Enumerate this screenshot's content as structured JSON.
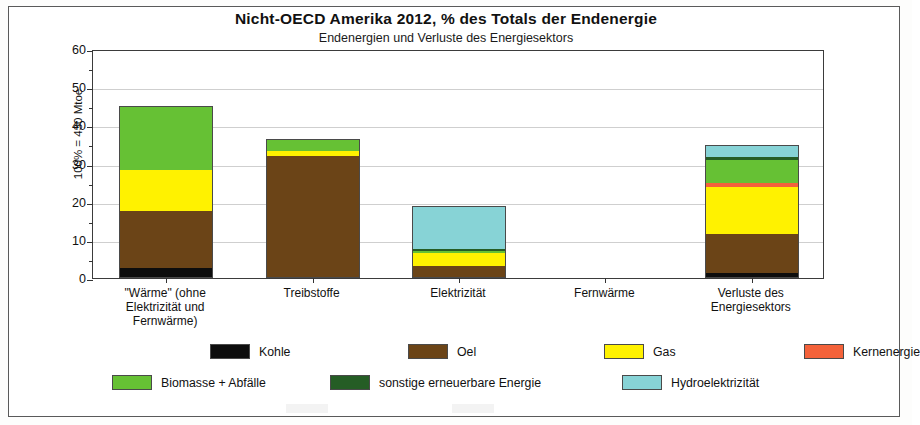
{
  "chart_data": {
    "type": "bar",
    "subtype": "stacked-column",
    "title": "Nicht-OECD Amerika  2012,  % des Totals der Endenergie",
    "subtitle": "Endenergien und Verluste des Energiesektors",
    "ylabel": "100% = 430 Mtoe",
    "xlabel": "",
    "ylim": [
      0,
      60
    ],
    "yticks": [
      0,
      10,
      20,
      30,
      40,
      50,
      60
    ],
    "yminorticks": [
      5,
      15,
      25,
      35,
      45,
      55
    ],
    "grid": "horizontal",
    "legend_position": "bottom",
    "categories": [
      "\"Wärme\" (ohne Elektrizität und Fernwärme)",
      "Treibstoffe",
      "Elektrizität",
      "Fernwärme",
      "Verluste des Energiesektors"
    ],
    "category_lines": [
      [
        "\"Wärme\" (ohne",
        "Elektrizität und",
        "Fernwärme)"
      ],
      [
        "Treibstoffe"
      ],
      [
        "Elektrizität"
      ],
      [
        "Fernwärme"
      ],
      [
        "Verluste des",
        "Energiesektors"
      ]
    ],
    "series": [
      {
        "name": "Kohle",
        "color": "#0d0d0d",
        "values": [
          2.6,
          0.0,
          0.0,
          0.0,
          1.3
        ]
      },
      {
        "name": "Oel",
        "color": "#6b4417",
        "values": [
          14.9,
          32.0,
          3.2,
          0.0,
          10.3
        ]
      },
      {
        "name": "Gas",
        "color": "#fff200",
        "values": [
          10.8,
          1.4,
          3.3,
          0.0,
          12.3
        ]
      },
      {
        "name": "Kernenergie",
        "color": "#f4623a",
        "values": [
          0.0,
          0.0,
          0.0,
          0.0,
          1.1
        ]
      },
      {
        "name": "Biomasse + Abfälle",
        "color": "#66c134",
        "values": [
          16.9,
          3.1,
          0.5,
          0.0,
          6.0
        ]
      },
      {
        "name": "sonstige erneuerbare Energie",
        "color": "#255d25",
        "values": [
          0.0,
          0.0,
          0.6,
          0.0,
          0.7
        ]
      },
      {
        "name": "Hydroelektrizität",
        "color": "#87d3d6",
        "values": [
          0.0,
          0.0,
          11.2,
          0.0,
          3.1
        ]
      }
    ],
    "totals": [
      45.2,
      36.5,
      18.8,
      0.0,
      34.8
    ]
  },
  "legend": {
    "row1": [
      {
        "label": "Kohle",
        "color": "#0d0d0d"
      },
      {
        "label": "Oel",
        "color": "#6b4417"
      },
      {
        "label": "Gas",
        "color": "#fff200"
      },
      {
        "label": "Kernenergie",
        "color": "#f4623a"
      }
    ],
    "row2": [
      {
        "label": "Biomasse + Abfälle",
        "color": "#66c134"
      },
      {
        "label": "sonstige erneuerbare Energie",
        "color": "#255d25"
      },
      {
        "label": "Hydroelektrizität",
        "color": "#87d3d6"
      }
    ]
  }
}
